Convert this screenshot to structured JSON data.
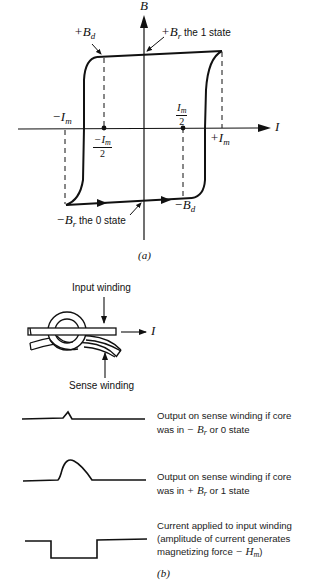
{
  "figure_a": {
    "caption": "(a)",
    "axes": {
      "y_label": "B",
      "x_label": "I"
    },
    "labels": {
      "plus_Bd": {
        "sign": "+",
        "sym": "B",
        "sub": "d"
      },
      "plus_Br": {
        "sign": "+",
        "sym": "B",
        "sub": "r",
        "text": " the 1 state"
      },
      "minus_Br": {
        "sign": "−",
        "sym": "B",
        "sub": "r",
        "text": " the 0 state"
      },
      "minus_Bd": {
        "sign": "−",
        "sym": "B",
        "sub": "d"
      },
      "minus_Im": {
        "sign": "−",
        "sym": "I",
        "sub": "m"
      },
      "plus_Im": {
        "sign": "+",
        "sym": "I",
        "sub": "m"
      },
      "minus_Im_half": {
        "num": "−I",
        "num_sub": "m",
        "den": "2"
      },
      "Im_half": {
        "num": "I",
        "num_sub": "m",
        "den": "2"
      }
    }
  },
  "figure_b": {
    "caption": "(b)",
    "core": {
      "input_winding_label": "Input winding",
      "sense_winding_label": "Sense winding",
      "current_label": "I"
    },
    "waveforms": [
      {
        "name": "output-0-state",
        "line1": "Output on sense winding if core",
        "line2_pre": "was in ",
        "line2_sign": "− ",
        "line2_sym": "B",
        "line2_sub": "r",
        "line2_post": " or 0 state"
      },
      {
        "name": "output-1-state",
        "line1": "Output on sense winding if core",
        "line2_pre": "was in ",
        "line2_sign": "+ ",
        "line2_sym": "B",
        "line2_sub": "r",
        "line2_post": " or 1 state"
      },
      {
        "name": "input-current",
        "line1": "Current applied to input winding",
        "line2": "(amplitude of current generates",
        "line3_pre": "magnetizing force ",
        "line3_sign": "− ",
        "line3_sym": "H",
        "line3_sub": "m",
        "line3_post": ")"
      }
    ]
  },
  "colors": {
    "ink": "#111111",
    "background": "#ffffff"
  }
}
